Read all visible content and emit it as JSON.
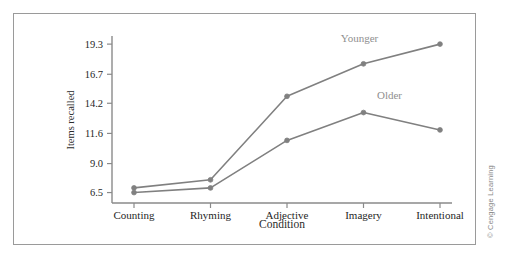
{
  "figure": {
    "copyright": "© Cengage Learning"
  },
  "chart_data": {
    "type": "line",
    "title": "",
    "xlabel": "Condition",
    "ylabel": "Items recalled",
    "categories": [
      "Counting",
      "Rhyming",
      "Adjective",
      "Imagery",
      "Intentional"
    ],
    "yticks": [
      "6.5",
      "9.0",
      "11.6",
      "14.2",
      "16.7",
      "19.3"
    ],
    "ytick_values": [
      6.5,
      9.0,
      11.6,
      14.2,
      16.7,
      19.3
    ],
    "ylim": [
      5.6,
      20.0
    ],
    "grid": false,
    "legend_position": "inline-annotations",
    "series": [
      {
        "name": "Younger",
        "color": "#808080",
        "values": [
          6.9,
          7.6,
          14.8,
          17.6,
          19.3
        ],
        "label_text": "Younger"
      },
      {
        "name": "Older",
        "color": "#808080",
        "values": [
          6.5,
          6.9,
          11.0,
          13.4,
          11.9
        ],
        "label_text": "Older"
      }
    ],
    "annotations": [
      {
        "text": "Younger",
        "series": "Younger"
      },
      {
        "text": "Older",
        "series": "Older"
      }
    ]
  }
}
